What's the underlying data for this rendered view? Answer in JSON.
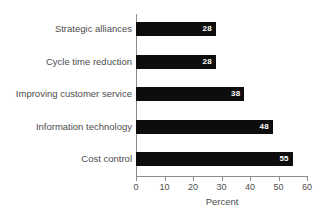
{
  "chart_data": {
    "type": "bar",
    "orientation": "horizontal",
    "title": "",
    "subtitle": "",
    "xlabel": "Percent",
    "ylabel": "",
    "categories": [
      "Strategic alliances",
      "Cycle time reduction",
      "Improving customer service",
      "Information technology",
      "Cost control"
    ],
    "values": [
      28,
      28,
      38,
      48,
      55
    ],
    "value_labels": [
      "28",
      "28",
      "38",
      "48",
      "55"
    ],
    "xlim": [
      0,
      60
    ],
    "xticks": [
      0,
      10,
      20,
      30,
      40,
      50,
      60
    ],
    "xtick_labels": [
      "0",
      "10",
      "20",
      "30",
      "40",
      "50",
      "60"
    ],
    "grid": false,
    "legend": false,
    "bar_color": "#0d0d0d",
    "value_label_color": "#ffffff",
    "axis_color": "#8b8b8b",
    "text_color": "#4d4d4d",
    "background": "#ffffff"
  }
}
